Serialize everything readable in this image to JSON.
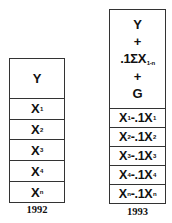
{
  "diagram": {
    "columns": [
      {
        "year": "1992",
        "header": {
          "lines": [
            "Y"
          ]
        },
        "rows": [
          {
            "main": "X",
            "sub": "1"
          },
          {
            "main": "X",
            "sub": "2"
          },
          {
            "main": "X",
            "sub": "3"
          },
          {
            "main": "X",
            "sub": "4"
          },
          {
            "main": "X",
            "sub": "n"
          }
        ]
      },
      {
        "year": "1993",
        "header": {
          "line1": "Y",
          "line2": "+",
          "line3_main": ".1ΣX",
          "line3_sub": "1-n",
          "line4": "+",
          "line5": "G"
        },
        "rows": [
          {
            "a": "X",
            "a_sub": "1",
            "op": "-.1X",
            "b_sub": "1"
          },
          {
            "a": "X",
            "a_sub": "2",
            "op": "-.1X",
            "b_sub": "2"
          },
          {
            "a": "X",
            "a_sub": "3",
            "op": "-.1X",
            "b_sub": "3"
          },
          {
            "a": "X",
            "a_sub": "4",
            "op": "-.1X",
            "b_sub": "4"
          },
          {
            "a": "X",
            "a_sub": "n",
            "op": "-.1X",
            "b_sub": "n"
          }
        ]
      }
    ]
  }
}
